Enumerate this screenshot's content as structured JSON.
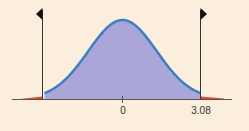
{
  "chart_data": {
    "type": "area",
    "title": "",
    "xlabel": "",
    "ylabel": "",
    "distribution": "normal",
    "mean": 0,
    "critical_values": [
      -3.08,
      3.08
    ],
    "tick_labels": [
      "0",
      "3.08"
    ],
    "shaded_regions": [
      {
        "name": "center",
        "from": -3.08,
        "to": 3.08,
        "color": "#aaa7d8"
      },
      {
        "name": "left-tail",
        "from": -4.2,
        "to": -3.08,
        "color": "#e04a2a"
      },
      {
        "name": "right-tail",
        "from": 3.08,
        "to": 4.2,
        "color": "#e04a2a"
      }
    ],
    "markers": [
      {
        "x": -3.08,
        "arrow": "left"
      },
      {
        "x": 3.08,
        "arrow": "right"
      }
    ],
    "colors": {
      "background": "#fbeedd",
      "curve": "#3d7fc0",
      "fill": "#aaa7d8",
      "tails": "#e04a2a",
      "axis": "#555555"
    },
    "grid": false,
    "legend": false
  },
  "labels": {
    "zero": "0",
    "critical": "3.08"
  }
}
